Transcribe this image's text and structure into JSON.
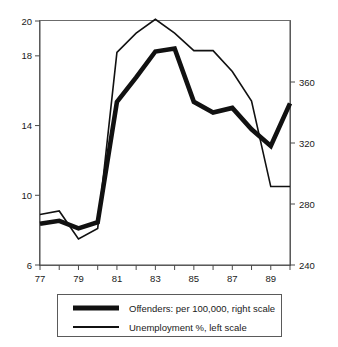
{
  "chart_data": {
    "type": "line",
    "title": "",
    "subtitle": "",
    "xlabel": "",
    "ylabel": "",
    "grid": false,
    "legend_position": "bottom",
    "x": [
      77,
      78,
      79,
      80,
      81,
      82,
      83,
      84,
      85,
      86,
      87,
      88,
      89,
      90
    ],
    "x_tick_values": [
      77,
      78,
      79,
      80,
      81,
      82,
      83,
      84,
      85,
      86,
      87,
      88,
      89,
      90
    ],
    "x_tick_labels": [
      "77",
      "",
      "79",
      "",
      "81",
      "",
      "83",
      "",
      "85",
      "",
      "87",
      "",
      "89",
      ""
    ],
    "xlim": [
      77,
      90
    ],
    "left_axis": {
      "label": "Unemployment %, left scale",
      "ticks": [
        6,
        10,
        14,
        18,
        20
      ],
      "tick_labels": [
        "6",
        "10",
        "14",
        "18",
        "20"
      ],
      "lim": [
        6,
        20
      ]
    },
    "right_axis": {
      "label": "Offenders: per 100,000, right scale",
      "ticks": [
        240,
        280,
        320,
        360
      ],
      "tick_labels": [
        "240",
        "280",
        "320",
        "360"
      ],
      "lim": [
        240,
        400
      ]
    },
    "series": [
      {
        "name": "Offenders: per 100,000, right scale",
        "axis": "right",
        "style": "thick",
        "color": "#111111",
        "values": [
          267,
          269,
          264,
          268,
          347,
          363,
          380,
          382,
          347,
          340,
          343,
          329,
          318,
          346
        ]
      },
      {
        "name": "Unemployment %, left scale",
        "axis": "left",
        "style": "thin",
        "color": "#111111",
        "values": [
          8.9,
          9.1,
          7.5,
          8.1,
          18.2,
          19.3,
          20.1,
          19.3,
          18.3,
          18.3,
          17.1,
          15.4,
          10.5,
          10.5
        ]
      }
    ],
    "legend": [
      {
        "label": "Offenders: per 100,000, right scale",
        "style": "thick"
      },
      {
        "label": "Unemployment %, left scale",
        "style": "thin"
      }
    ]
  }
}
